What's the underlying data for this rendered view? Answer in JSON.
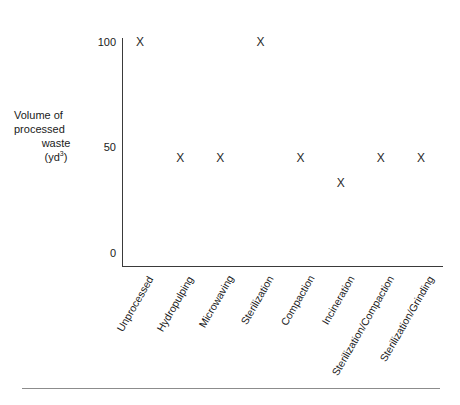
{
  "chart_data": {
    "type": "scatter",
    "title": "",
    "subtitle": "",
    "xlabel": "",
    "ylabel": "Volume of processed waste (yd³)",
    "ylabel_lines": [
      "Volume of",
      "processed",
      "waste",
      "(yd",
      "3",
      ")"
    ],
    "ylim": [
      0,
      105
    ],
    "yticks": [
      0,
      50,
      100
    ],
    "ytick_labels": [
      "0",
      "50",
      "100"
    ],
    "grid": false,
    "legend": false,
    "marker_symbol": "X",
    "marker_color": "#2b2b2b",
    "categories": [
      "Unprocessed",
      "Hydropulping",
      "Microwaving",
      "Sterilization",
      "Compaction",
      "Incineration",
      "Sterilization/Compaction",
      "Sterilization/Grinding"
    ],
    "values": [
      100,
      45,
      45,
      100,
      45,
      33,
      45,
      45
    ],
    "points": [
      {
        "category": "Unprocessed",
        "value": 100
      },
      {
        "category": "Hydropulping",
        "value": 45
      },
      {
        "category": "Microwaving",
        "value": 45
      },
      {
        "category": "Sterilization",
        "value": 100
      },
      {
        "category": "Compaction",
        "value": 45
      },
      {
        "category": "Incineration",
        "value": 33
      },
      {
        "category": "Sterilization/Compaction",
        "value": 45
      },
      {
        "category": "Sterilization/Grinding",
        "value": 45
      }
    ]
  },
  "axis": {
    "line_color": "#3a3a3a"
  },
  "footer": {
    "rule_color": "#8c8c8c"
  }
}
